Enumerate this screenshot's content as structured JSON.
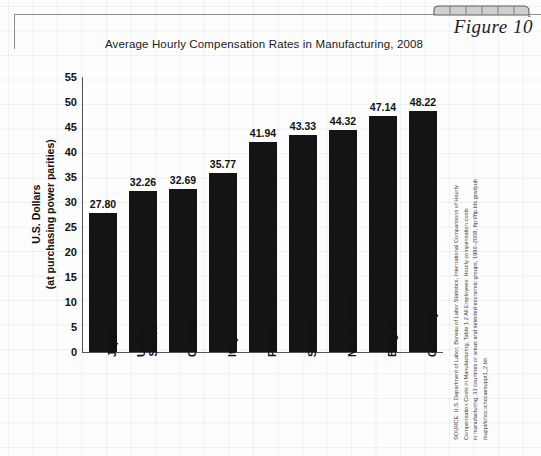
{
  "figure": {
    "label": "Figure 10",
    "tab_icon": "decorative-tab"
  },
  "chart_data": {
    "type": "bar",
    "title": "Average Hourly Compensation Rates in Manufacturing, 2008",
    "xlabel": "",
    "ylabel": "U.S. Dollars (at purchasing power parities)",
    "ylabel_line1": "U.S. Dollars",
    "ylabel_line2": "(at purchasing power parities)",
    "ylim": [
      0,
      55
    ],
    "yticks": [
      55,
      50,
      45,
      40,
      35,
      30,
      25,
      20,
      15,
      10,
      5,
      0
    ],
    "grid": false,
    "legend": "none",
    "bar_color": "#141414",
    "categories": [
      "Japan",
      "United States",
      "Canada",
      "Italy",
      "France",
      "Sweden",
      "Netherlands",
      "Belgium",
      "Germany"
    ],
    "category_lines": [
      [
        "Japan"
      ],
      [
        "United",
        "States"
      ],
      [
        "Canada"
      ],
      [
        "Italy"
      ],
      [
        "France"
      ],
      [
        "Sweden"
      ],
      [
        "Netherlands"
      ],
      [
        "Belgium"
      ],
      [
        "Germany"
      ]
    ],
    "values": [
      27.8,
      32.26,
      32.69,
      35.77,
      41.94,
      43.33,
      44.32,
      47.14,
      48.22
    ],
    "value_labels": [
      "27.80",
      "32.26",
      "32.69",
      "35.77",
      "41.94",
      "43.33",
      "44.32",
      "47.14",
      "48.22"
    ]
  },
  "source": {
    "lines": [
      "SOURCE: U.S. Department of Labor, Bureau of Labor Statistics, International Comparisons of Hourly",
      "Compensation Costs in Manufacturing, Table 1.2 All Employees: Hourly compensation costs",
      "in manufacturing, 33 countries or areas and selected economic groups, 1996–2008, ftp://ftp.bls.gov/pub",
      "/suppl/ichcc.ichccaesuppt1_2.txt"
    ]
  }
}
